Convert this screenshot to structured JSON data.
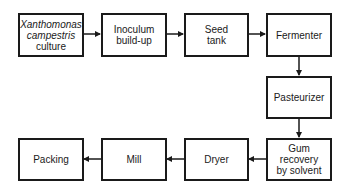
{
  "diagram": {
    "type": "process-flowchart",
    "nodes": [
      {
        "id": "culture",
        "lines": [
          "Xanthomonas",
          "campestris",
          "culture"
        ],
        "italic_lines": [
          0,
          1
        ]
      },
      {
        "id": "inoculum",
        "lines": [
          "Inoculum",
          "build-up"
        ]
      },
      {
        "id": "seed",
        "lines": [
          "Seed",
          "tank"
        ]
      },
      {
        "id": "fermenter",
        "lines": [
          "Fermenter"
        ]
      },
      {
        "id": "pasteurizer",
        "lines": [
          "Pasteurizer"
        ]
      },
      {
        "id": "gum",
        "lines": [
          "Gum",
          "recovery",
          "by solvent"
        ]
      },
      {
        "id": "dryer",
        "lines": [
          "Dryer"
        ]
      },
      {
        "id": "mill",
        "lines": [
          "Mill"
        ]
      },
      {
        "id": "packing",
        "lines": [
          "Packing"
        ]
      }
    ],
    "edges": [
      {
        "from": "culture",
        "to": "inoculum"
      },
      {
        "from": "inoculum",
        "to": "seed"
      },
      {
        "from": "seed",
        "to": "fermenter"
      },
      {
        "from": "fermenter",
        "to": "pasteurizer"
      },
      {
        "from": "pasteurizer",
        "to": "gum"
      },
      {
        "from": "gum",
        "to": "dryer"
      },
      {
        "from": "dryer",
        "to": "mill"
      },
      {
        "from": "mill",
        "to": "packing"
      }
    ],
    "colors": {
      "stroke": "#1a1a1a",
      "background": "#ffffff"
    }
  }
}
